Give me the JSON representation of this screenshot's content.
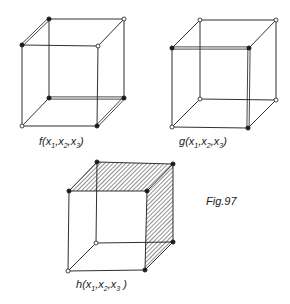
{
  "figure": {
    "caption": "Fig.97",
    "colors": {
      "line": "#1a1a1a",
      "background": "#ffffff",
      "hatch": "#333333"
    },
    "cubes": [
      {
        "id": "f",
        "label": {
          "func": "f",
          "args": [
            "x",
            "1",
            "x",
            "2",
            "x",
            "3"
          ]
        },
        "vertices": {
          "tbl": {
            "x": 49,
            "y": 19,
            "filled": true
          },
          "tbr": {
            "x": 124,
            "y": 19,
            "filled": false
          },
          "tfl": {
            "x": 22,
            "y": 45,
            "filled": true
          },
          "tfr": {
            "x": 98,
            "y": 46,
            "filled": false
          },
          "bbl": {
            "x": 49,
            "y": 98,
            "filled": true
          },
          "bbr": {
            "x": 124,
            "y": 98,
            "filled": true
          },
          "bfl": {
            "x": 22,
            "y": 126,
            "filled": false
          },
          "bfr": {
            "x": 97,
            "y": 126,
            "filled": true
          }
        },
        "double_edges": [
          [
            "tfl",
            "tbl"
          ],
          [
            "bbl",
            "bbr"
          ],
          [
            "bbr",
            "bfr"
          ]
        ],
        "hatched_faces": []
      },
      {
        "id": "g",
        "label": {
          "func": "g",
          "args": [
            "x",
            "1",
            "x",
            "2",
            "x",
            "3"
          ]
        },
        "vertices": {
          "tbl": {
            "x": 200,
            "y": 20,
            "filled": false
          },
          "tbr": {
            "x": 276,
            "y": 20,
            "filled": false
          },
          "tfl": {
            "x": 172,
            "y": 48,
            "filled": true
          },
          "tfr": {
            "x": 249,
            "y": 48,
            "filled": true
          },
          "bbl": {
            "x": 200,
            "y": 99,
            "filled": false
          },
          "bbr": {
            "x": 276,
            "y": 100,
            "filled": false
          },
          "bfl": {
            "x": 172,
            "y": 127,
            "filled": false
          },
          "bfr": {
            "x": 248,
            "y": 128,
            "filled": true
          }
        },
        "double_edges": [
          [
            "tfl",
            "tfr"
          ],
          [
            "tfr",
            "bfr"
          ]
        ],
        "hatched_faces": []
      },
      {
        "id": "h",
        "label": {
          "func": "h",
          "args": [
            "x",
            "1",
            "x",
            "2",
            "x",
            "3"
          ]
        },
        "vertices": {
          "tbl": {
            "x": 97,
            "y": 162,
            "filled": true
          },
          "tbr": {
            "x": 173,
            "y": 164,
            "filled": true
          },
          "tfl": {
            "x": 69,
            "y": 191,
            "filled": true
          },
          "tfr": {
            "x": 147,
            "y": 191,
            "filled": true
          },
          "bbl": {
            "x": 96,
            "y": 243,
            "filled": false
          },
          "bbr": {
            "x": 173,
            "y": 242,
            "filled": true
          },
          "bfl": {
            "x": 68,
            "y": 271,
            "filled": false
          },
          "bfr": {
            "x": 145,
            "y": 270,
            "filled": true
          }
        },
        "double_edges": [],
        "hatched_faces": [
          [
            "tfl",
            "tbl",
            "tbr",
            "tfr"
          ],
          [
            "tfr",
            "tbr",
            "bbr",
            "bfr"
          ]
        ]
      }
    ]
  }
}
